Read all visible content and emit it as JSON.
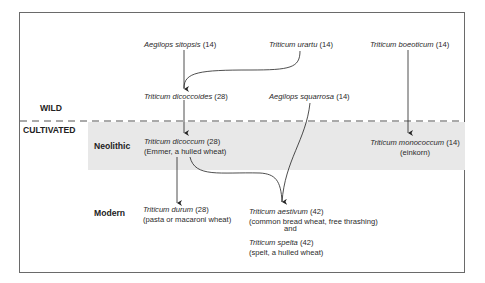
{
  "zones": {
    "wild": "WILD",
    "cultivated": "CULTIVATED",
    "neolithic": "Neolithic",
    "modern": "Modern"
  },
  "species": {
    "aegilops_sitopsis": {
      "name": "Aegilops sitopsis",
      "chrom": "(14)"
    },
    "triticum_urartu": {
      "name": "Triticum urartu",
      "chrom": "(14)"
    },
    "triticum_boeoticum": {
      "name": "Triticum boeoticum",
      "chrom": "(14)"
    },
    "triticum_dicoccoides": {
      "name": "Triticum dicoccoides",
      "chrom": "(28)"
    },
    "aegilops_squarrosa": {
      "name": "Aegilops squarrosa",
      "chrom": "(14)"
    },
    "triticum_dicoccum": {
      "name": "Triticum dicoccum",
      "chrom": "(28)",
      "note": "(Emmer, a hulled wheat)"
    },
    "triticum_monococcum": {
      "name": "Triticum monococcum",
      "chrom": "(14)",
      "note": "(einkorn)"
    },
    "triticum_durum": {
      "name": "Triticum durum",
      "chrom": "(28)",
      "note": "(pasta or macaroni wheat)"
    },
    "triticum_aestivum": {
      "name": "Triticum aestivum",
      "chrom": "(42)",
      "note": "(common bread wheat, free thrashing)"
    },
    "conjunction": "and",
    "triticum_spelta": {
      "name": "Triticum spelta",
      "chrom": "(42)",
      "note": "(spelt, a hulled wheat)"
    }
  },
  "edges": [
    {
      "from": "Aegilops sitopsis",
      "to": "Triticum dicoccoides"
    },
    {
      "from": "Triticum urartu",
      "to": "Triticum dicoccoides"
    },
    {
      "from": "Triticum dicoccoides",
      "to": "Triticum dicoccum"
    },
    {
      "from": "Triticum boeoticum",
      "to": "Triticum monococcum"
    },
    {
      "from": "Triticum dicoccum",
      "to": "Triticum durum"
    },
    {
      "from": "Triticum dicoccum",
      "to": "Triticum aestivum"
    },
    {
      "from": "Aegilops squarrosa",
      "to": "Triticum aestivum"
    }
  ],
  "colors": {
    "frame": "#6a6a6a",
    "neolithic_shade": "#e8e8e8",
    "lines": "#333333"
  }
}
